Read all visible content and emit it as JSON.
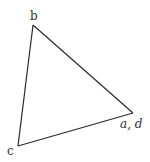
{
  "diagram": {
    "type": "triangle",
    "vertices": [
      {
        "id": "b",
        "label": "b",
        "x": 33,
        "y": 25,
        "label_x": 30,
        "label_y": 20
      },
      {
        "id": "ad",
        "label": "a, d",
        "x": 133,
        "y": 113,
        "label_x": 120,
        "label_y": 128
      },
      {
        "id": "c",
        "label": "c",
        "x": 18,
        "y": 146,
        "label_x": 7,
        "label_y": 155
      }
    ],
    "edges": [
      {
        "from": "b",
        "to": "ad"
      },
      {
        "from": "ad",
        "to": "c"
      },
      {
        "from": "c",
        "to": "b"
      }
    ],
    "colors": {
      "stroke": "#2a2a2a",
      "label": "#333333",
      "background": "#ffffff"
    }
  }
}
